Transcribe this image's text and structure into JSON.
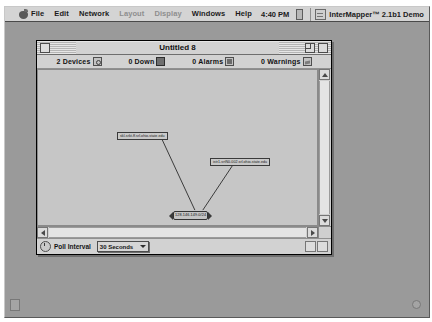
{
  "menubar": {
    "apple_icon": "apple-icon",
    "items": [
      {
        "label": "File",
        "enabled": true
      },
      {
        "label": "Edit",
        "enabled": true
      },
      {
        "label": "Network",
        "enabled": true
      },
      {
        "label": "Layout",
        "enabled": false
      },
      {
        "label": "Display",
        "enabled": false
      },
      {
        "label": "Windows",
        "enabled": true
      },
      {
        "label": "Help",
        "enabled": true
      }
    ],
    "clock": "4:40 PM",
    "app_name": "InterMapper™ 2.1b1 Demo"
  },
  "window": {
    "title": "Untitled 8",
    "counts": [
      {
        "label": "2 Devices",
        "icon": "devices-icon"
      },
      {
        "label": "0 Down",
        "icon": "down-icon"
      },
      {
        "label": "0 Alarms",
        "icon": "alarms-icon"
      },
      {
        "label": "0 Warnings",
        "icon": "warnings-icon"
      }
    ],
    "map": {
      "nodes": [
        {
          "id": "node-a",
          "label": "skl-srkt-ff.srl.ohio-state.edu"
        },
        {
          "id": "node-b",
          "label": "istr1-srtN0-002.srl.ohio-state.edu"
        }
      ],
      "network": {
        "label": "128.146.149.0/24"
      }
    },
    "bottom": {
      "poll_label": "Poll Interval",
      "poll_value": "30 Seconds"
    }
  }
}
